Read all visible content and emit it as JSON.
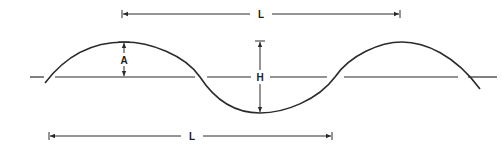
{
  "figure": {
    "type": "wave-diagram",
    "colors": {
      "line": "#2a2a2a",
      "background": "#ffffff"
    },
    "labels": {
      "amplitude": "A",
      "height": "H",
      "wavelength_top": "L",
      "wavelength_bottom": "L"
    }
  }
}
